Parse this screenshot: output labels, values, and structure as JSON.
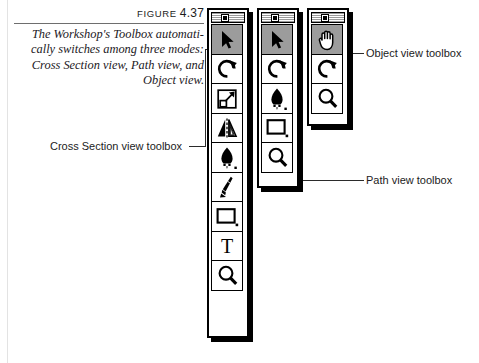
{
  "figure": {
    "label_word": "FIGURE",
    "label_number": "4.37",
    "caption": "The Workshop's Toolbox automatically switches among three modes: Cross Section view, Path view, and Object view.",
    "caption_lines": [
      "The Workshop's Toolbox automati-",
      "cally switches among three modes:",
      "Cross Section view, Path view, and",
      "Object view."
    ]
  },
  "callouts": {
    "cross_section": "Cross Section view toolbox",
    "object_view": "Object view toolbox",
    "path_view": "Path view toolbox"
  },
  "palettes": [
    {
      "id": "cross-section-view-toolbox",
      "name": "Cross Section view toolbox",
      "close_box": "close-box",
      "tools": [
        {
          "icon": "arrow-select-icon",
          "label": "Selection",
          "selected": true
        },
        {
          "icon": "rotate-icon",
          "label": "Rotate",
          "selected": false
        },
        {
          "icon": "scale-icon",
          "label": "Scale",
          "selected": false
        },
        {
          "icon": "mirror-icon",
          "label": "Mirror",
          "selected": false
        },
        {
          "icon": "pen-nib-icon",
          "label": "Pen",
          "selected": false
        },
        {
          "icon": "brush-icon",
          "label": "Brush",
          "selected": false
        },
        {
          "icon": "rectangle-icon",
          "label": "Rectangle",
          "selected": false
        },
        {
          "icon": "text-tool-icon",
          "label": "Text",
          "selected": false
        },
        {
          "icon": "magnifier-icon",
          "label": "Zoom",
          "selected": false
        }
      ]
    },
    {
      "id": "path-view-toolbox",
      "name": "Path view toolbox",
      "close_box": "close-box",
      "tools": [
        {
          "icon": "arrow-select-icon",
          "label": "Selection",
          "selected": true
        },
        {
          "icon": "rotate-icon",
          "label": "Rotate",
          "selected": false
        },
        {
          "icon": "pen-nib-icon",
          "label": "Pen",
          "selected": false
        },
        {
          "icon": "rectangle-icon",
          "label": "Rectangle",
          "selected": false
        },
        {
          "icon": "magnifier-icon",
          "label": "Zoom",
          "selected": false
        }
      ]
    },
    {
      "id": "object-view-toolbox",
      "name": "Object view toolbox",
      "close_box": "close-box",
      "tools": [
        {
          "icon": "hand-icon",
          "label": "Hand",
          "selected": true
        },
        {
          "icon": "rotate-icon",
          "label": "Rotate",
          "selected": false
        },
        {
          "icon": "magnifier-icon",
          "label": "Zoom",
          "selected": false
        }
      ]
    }
  ],
  "colors": {
    "selected_cell": "#9c9c9c",
    "ink": "#000000",
    "rule": "#6e6e6e",
    "page": "#ffffff"
  }
}
